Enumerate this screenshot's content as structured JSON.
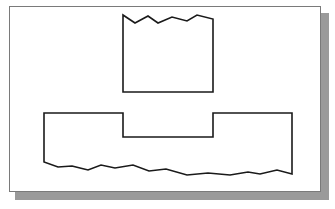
{
  "figure": {
    "colors": {
      "background": "#ffffff",
      "paper": "#ffffff",
      "paper_border": "#7a7a7a",
      "shadow": "#9a9a9a",
      "line": "#1a1a1a"
    },
    "stroke_width": 1.6,
    "shapes": {
      "upper_block": {
        "points": "123,15 135,23 148,16 158,23 172,17 187,21 197,15 213,19 213,92 123,92"
      },
      "lower_base": {
        "points": "44,113 123,113 123,137 213,137 213,113 292,113 292,174 277,170 260,174 248,172 230,175 208,173 187,175 166,169 149,171 133,165 115,168 101,165 88,170 72,166 58,167 44,162"
      }
    }
  }
}
